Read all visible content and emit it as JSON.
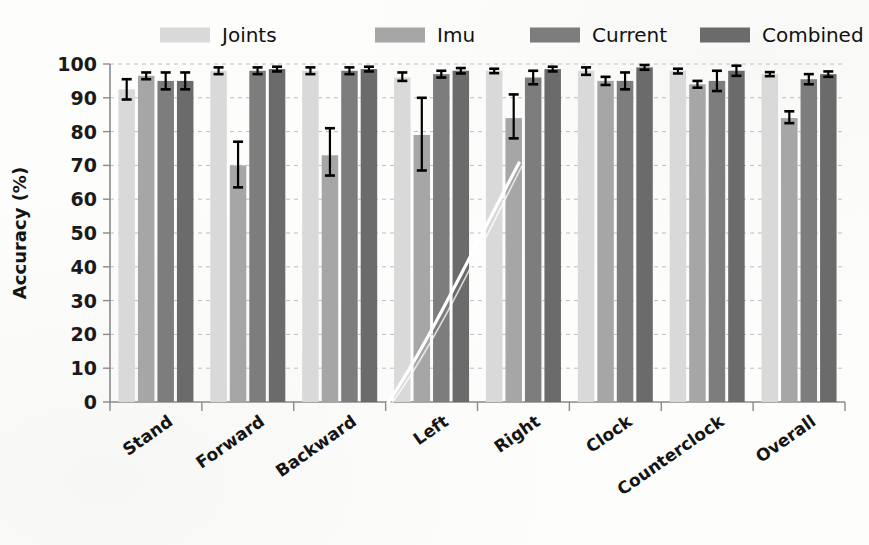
{
  "chart_data": {
    "type": "bar",
    "title": "",
    "subtitle": "",
    "xlabel": "",
    "ylabel": "Accuracy (%)",
    "ylim": [
      0,
      100
    ],
    "ytick_step": 10,
    "yticks": [
      0,
      10,
      20,
      30,
      40,
      50,
      60,
      70,
      80,
      90,
      100
    ],
    "grid": true,
    "grid_axis": "y",
    "legend_position": "top",
    "categories": [
      "Stand",
      "Forward",
      "Backward",
      "Left",
      "Right",
      "Clock",
      "Counterclock",
      "Overall"
    ],
    "series": [
      {
        "name": "Joints",
        "color": "#d9d9d9",
        "values": [
          92.5,
          98.0,
          98.0,
          96.0,
          98.0,
          98.0,
          98.0,
          97.0
        ],
        "err_low": [
          89.5,
          97.0,
          97.0,
          95.0,
          97.3,
          96.8,
          97.2,
          96.4
        ],
        "err_high": [
          95.5,
          99.0,
          99.0,
          97.5,
          98.6,
          99.0,
          98.6,
          97.6
        ]
      },
      {
        "name": "Imu",
        "color": "#a6a6a6",
        "values": [
          96.5,
          70.0,
          73.0,
          79.0,
          84.0,
          95.0,
          94.0,
          84.0
        ],
        "err_low": [
          95.5,
          63.5,
          67.0,
          68.5,
          78.0,
          93.8,
          93.0,
          82.5
        ],
        "err_high": [
          97.5,
          77.0,
          81.0,
          90.0,
          91.0,
          96.2,
          95.0,
          86.0
        ]
      },
      {
        "name": "Current",
        "color": "#7d7d7d",
        "values": [
          95.0,
          98.0,
          98.0,
          97.0,
          96.0,
          95.0,
          95.0,
          95.5
        ],
        "err_low": [
          92.5,
          97.0,
          97.0,
          96.0,
          94.0,
          92.5,
          92.0,
          94.0
        ],
        "err_high": [
          97.5,
          99.0,
          99.0,
          98.0,
          98.0,
          97.5,
          98.0,
          97.0
        ]
      },
      {
        "name": "Combined",
        "color": "#6b6b6b",
        "values": [
          95.0,
          98.5,
          98.5,
          98.0,
          98.5,
          99.0,
          98.0,
          97.0
        ],
        "err_low": [
          92.5,
          97.8,
          97.8,
          97.2,
          97.8,
          98.3,
          96.5,
          96.2
        ],
        "err_high": [
          97.5,
          99.2,
          99.2,
          98.8,
          99.2,
          99.7,
          99.5,
          97.8
        ]
      }
    ],
    "annotations": [
      {
        "name": "scan-crease",
        "type": "line",
        "description": "white diagonal scanning artifact"
      }
    ]
  },
  "legend": {
    "entries": [
      {
        "label": "Joints",
        "color": "#d9d9d9"
      },
      {
        "label": "Imu",
        "color": "#a6a6a6"
      },
      {
        "label": "Current",
        "color": "#7d7d7d"
      },
      {
        "label": "Combined",
        "color": "#6b6b6b"
      }
    ]
  },
  "axes": {
    "y_title": "Accuracy (%)",
    "y_labels": [
      "100",
      "90",
      "80",
      "70",
      "60",
      "50",
      "40",
      "30",
      "20",
      "10",
      "0"
    ],
    "x_labels": [
      "Stand",
      "Forward",
      "Backward",
      "Left",
      "Right",
      "Clock",
      "Counterclock",
      "Overall"
    ]
  },
  "colors": {
    "joints": "#d9d9d9",
    "imu": "#a6a6a6",
    "current": "#7d7d7d",
    "combined": "#6b6b6b",
    "axis": "#8a8a8a",
    "grid": "#bdbdbd",
    "text": "#141414",
    "background": "#fdfdfc"
  }
}
